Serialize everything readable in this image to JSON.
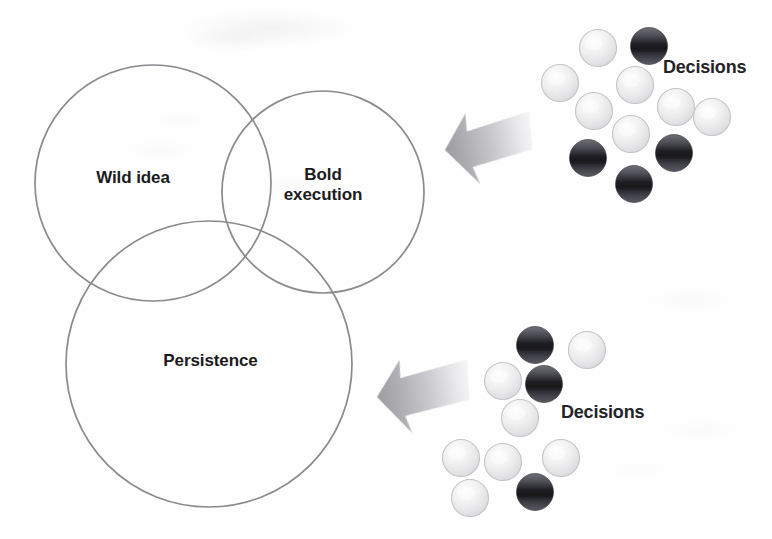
{
  "figure": {
    "type": "venn-diagram-with-decision-clusters",
    "background_color": "#fefefe",
    "circle_stroke_color": "#8a8a8f",
    "text_color": "#1b1b1d",
    "arrow_color_dark": "#a9a9ad",
    "arrow_color_light": "#e9e9ec",
    "sphere_light_color": "#ececed",
    "sphere_dark_color": "#3a3a3e"
  },
  "venn": {
    "circles": [
      {
        "id": "wild-idea",
        "label": "Wild idea",
        "cx": 153,
        "cy": 183,
        "r": 118
      },
      {
        "id": "bold-execution",
        "label": "Bold\nexecution",
        "cx": 323,
        "cy": 192,
        "r": 101
      },
      {
        "id": "persistence",
        "label": "Persistence",
        "cx": 209,
        "cy": 364,
        "r": 143
      }
    ],
    "labels": {
      "wild_idea": "Wild idea",
      "bold_execution": "Bold\nexecution",
      "persistence": "Persistence"
    },
    "label_positions": [
      {
        "id": "wild-idea",
        "x": 78,
        "y": 168,
        "w": 110,
        "font_size": 17
      },
      {
        "id": "bold-execution",
        "x": 273,
        "y": 165,
        "w": 100,
        "font_size": 17
      },
      {
        "id": "persistence",
        "x": 148,
        "y": 351,
        "w": 125,
        "font_size": 17
      }
    ]
  },
  "arrows": [
    {
      "id": "arrow-top",
      "label": "decisions-to-bold-execution-arrow",
      "tip_x": 445,
      "tip_y": 150,
      "tail_x": 533,
      "tail_y": 123,
      "rotation": -11
    },
    {
      "id": "arrow-bottom",
      "label": "decisions-to-persistence-arrow",
      "tip_x": 377,
      "tip_y": 397,
      "tail_x": 470,
      "tail_y": 375,
      "rotation": -9
    }
  ],
  "clusters": [
    {
      "id": "cluster-top",
      "label": "Decisions",
      "label_x": 663,
      "label_y": 57,
      "label_font_size": 18,
      "sphere_diameter": 37,
      "spheres": [
        {
          "cx": 598,
          "cy": 48,
          "tone": "light"
        },
        {
          "cx": 649,
          "cy": 46,
          "tone": "dark"
        },
        {
          "cx": 560,
          "cy": 83,
          "tone": "light"
        },
        {
          "cx": 635,
          "cy": 85,
          "tone": "light"
        },
        {
          "cx": 594,
          "cy": 111,
          "tone": "light"
        },
        {
          "cx": 676,
          "cy": 107,
          "tone": "light"
        },
        {
          "cx": 712,
          "cy": 117,
          "tone": "light"
        },
        {
          "cx": 631,
          "cy": 134,
          "tone": "light"
        },
        {
          "cx": 588,
          "cy": 158,
          "tone": "dark"
        },
        {
          "cx": 674,
          "cy": 153,
          "tone": "dark"
        },
        {
          "cx": 634,
          "cy": 184,
          "tone": "dark"
        }
      ]
    },
    {
      "id": "cluster-bottom",
      "label": "Decisions",
      "label_x": 561,
      "label_y": 402,
      "label_font_size": 18,
      "sphere_diameter": 37,
      "spheres": [
        {
          "cx": 535,
          "cy": 345,
          "tone": "dark"
        },
        {
          "cx": 587,
          "cy": 350,
          "tone": "light"
        },
        {
          "cx": 503,
          "cy": 381,
          "tone": "light"
        },
        {
          "cx": 544,
          "cy": 384,
          "tone": "dark"
        },
        {
          "cx": 520,
          "cy": 418,
          "tone": "light"
        },
        {
          "cx": 461,
          "cy": 458,
          "tone": "light"
        },
        {
          "cx": 503,
          "cy": 462,
          "tone": "light"
        },
        {
          "cx": 561,
          "cy": 458,
          "tone": "light"
        },
        {
          "cx": 535,
          "cy": 492,
          "tone": "dark"
        },
        {
          "cx": 470,
          "cy": 498,
          "tone": "light"
        }
      ]
    }
  ]
}
